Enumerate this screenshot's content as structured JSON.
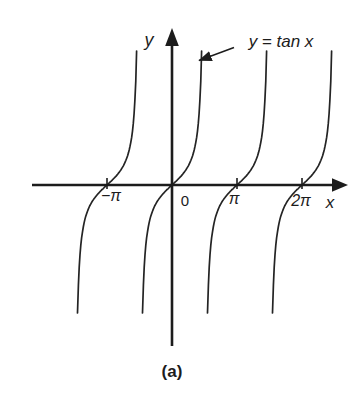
{
  "figure": {
    "y_axis_label": "y",
    "x_axis_label": "x",
    "equation_label": "y = tan x",
    "caption": "(a)",
    "ink_color": "#1c1c1c",
    "background_color": "#ffffff"
  },
  "chart_data": {
    "type": "line",
    "function": "y = tan x",
    "xlabel": "x",
    "ylabel": "y",
    "caption": "(a)",
    "grid": false,
    "legend": false,
    "period_pi": 1,
    "x_range_pi": [
      -1.5,
      2.5
    ],
    "branch_centers_pi": [
      -1,
      0,
      1,
      2
    ],
    "asymptotes_pi": [
      -1.5,
      -0.5,
      0.5,
      1.5,
      2.5
    ],
    "x_ticks": [
      {
        "value_pi": -1,
        "label": "−π",
        "has_tick_mark": true
      },
      {
        "value_pi": 0,
        "label": "0",
        "has_tick_mark": false
      },
      {
        "value_pi": 1,
        "label": "π",
        "has_tick_mark": true
      },
      {
        "value_pi": 2,
        "label": "2π",
        "has_tick_mark": true
      }
    ],
    "annotation": {
      "text": "y = tan x",
      "points_to": "branch through the origin"
    }
  }
}
